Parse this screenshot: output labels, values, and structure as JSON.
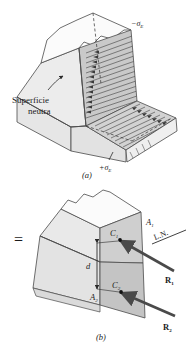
{
  "figure": {
    "title_semantic": "bending-stress-and-resultant-forces-on-trapezoidal-section",
    "panel_a": {
      "caption": "(a)",
      "labels": {
        "top_stress": "−σ",
        "top_stress_sub": "E",
        "bottom_stress": "+σ",
        "bottom_stress_sub": "E",
        "neutral_surface_line1": "Superficie",
        "neutral_surface_line2": "neutra"
      }
    },
    "panel_b": {
      "caption": "(b)",
      "equals_sign": "=",
      "labels": {
        "area_top": "A",
        "area_top_sub": "1",
        "area_bottom": "A",
        "area_bottom_sub": "2",
        "centroid_top": "C",
        "centroid_top_sub": "1",
        "centroid_bottom": "C",
        "centroid_bottom_sub": "2",
        "distance": "d",
        "neutral_axis": "L.N.",
        "resultant_top": "R",
        "resultant_top_sub": "1",
        "resultant_bottom": "R",
        "resultant_bottom_sub": "2"
      }
    },
    "colors": {
      "background": "#ffffff",
      "outline": "#3c3c3c",
      "face_light": "#f2f2f2",
      "face_mid": "#dcdcdc",
      "face_dark": "#c8c8c8",
      "face_darker": "#b4b4b4",
      "hatch": "#5a5a5a",
      "arrow": "#4a4a4a",
      "text": "#1b1b1b"
    }
  }
}
